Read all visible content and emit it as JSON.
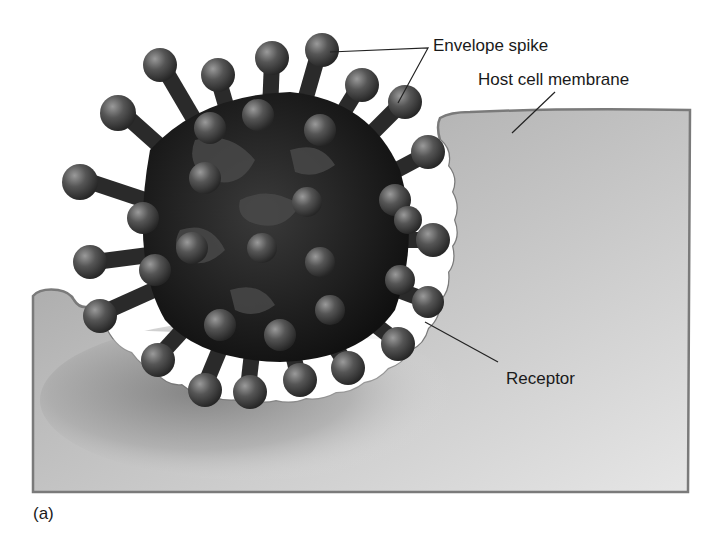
{
  "figure": {
    "panel_label": "(a)",
    "labels": {
      "envelope_spike": "Envelope spike",
      "host_cell_membrane": "Host cell membrane",
      "receptor": "Receptor"
    },
    "colors": {
      "background": "#ffffff",
      "cell_fill_light": "#e4e4e4",
      "cell_fill_dark": "#8a8a8a",
      "membrane_edge": "#7a7a7a",
      "virus_core": "#1c1c1c",
      "virus_spike": "#4a4a4a",
      "leader_line": "#222222"
    }
  }
}
